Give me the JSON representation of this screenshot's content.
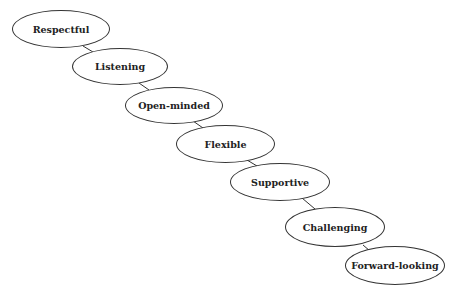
{
  "diagram": {
    "nodes": [
      {
        "label": "Respectful"
      },
      {
        "label": "Listening"
      },
      {
        "label": "Open-minded"
      },
      {
        "label": "Flexible"
      },
      {
        "label": "Supportive"
      },
      {
        "label": "Challenging"
      },
      {
        "label": "Forward-looking"
      }
    ],
    "colors": {
      "stroke": "#333333",
      "fill": "#ffffff",
      "text": "#222222"
    }
  }
}
